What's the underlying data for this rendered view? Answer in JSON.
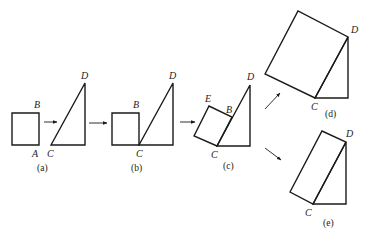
{
  "figure": {
    "panels": [
      {
        "id": "a",
        "caption": "(a)",
        "labels": {
          "B": "B",
          "A": "A",
          "C": "C",
          "D": "D"
        },
        "square": [
          [
            12,
            113
          ],
          [
            39,
            113
          ],
          [
            39,
            145
          ],
          [
            12,
            145
          ]
        ],
        "triangle": [
          [
            51,
            145
          ],
          [
            85,
            83
          ],
          [
            85,
            145
          ]
        ]
      },
      {
        "id": "b",
        "caption": "(b)",
        "labels": {
          "B": "B",
          "C": "C",
          "D": "D"
        },
        "square": [
          [
            112,
            113
          ],
          [
            139,
            113
          ],
          [
            139,
            145
          ],
          [
            112,
            145
          ]
        ],
        "triangle": [
          [
            139,
            145
          ],
          [
            173,
            83
          ],
          [
            173,
            145
          ]
        ]
      },
      {
        "id": "c",
        "caption": "(c)",
        "labels": {
          "E": "E",
          "B": "B",
          "C": "C",
          "D": "D"
        },
        "square": [
          [
            194,
            136
          ],
          [
            209,
            106
          ],
          [
            232,
            117
          ],
          [
            217,
            146
          ]
        ],
        "triangle": [
          [
            217,
            146
          ],
          [
            250,
            85
          ],
          [
            250,
            146
          ]
        ]
      },
      {
        "id": "d",
        "caption": "(d)",
        "labels": {
          "C": "C",
          "D": "D"
        },
        "square": [
          [
            265,
            74
          ],
          [
            298,
            11
          ],
          [
            348,
            37
          ],
          [
            315,
            98
          ]
        ],
        "triangle": [
          [
            315,
            98
          ],
          [
            348,
            37
          ],
          [
            348,
            98
          ]
        ]
      },
      {
        "id": "e",
        "caption": "(e)",
        "labels": {
          "C": "C",
          "D": "D"
        },
        "square": [
          [
            290,
            192
          ],
          [
            322,
            131
          ],
          [
            346,
            142
          ],
          [
            313,
            204
          ]
        ],
        "triangle": [
          [
            313,
            204
          ],
          [
            346,
            142
          ],
          [
            346,
            204
          ]
        ]
      }
    ],
    "arrows": [
      {
        "from": [
          44,
          122
        ],
        "to": [
          57,
          122
        ]
      },
      {
        "from": [
          89,
          123
        ],
        "to": [
          107,
          123
        ]
      },
      {
        "from": [
          180,
          122
        ],
        "to": [
          195,
          122
        ]
      },
      {
        "from": [
          265,
          109
        ],
        "to": [
          280,
          93
        ]
      },
      {
        "from": [
          265,
          148
        ],
        "to": [
          281,
          160
        ]
      }
    ]
  }
}
